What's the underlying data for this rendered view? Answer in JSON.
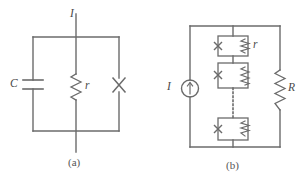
{
  "figure": {
    "caption_a": "(a)",
    "caption_b": "(b)",
    "stroke_color": "#6b6b6b",
    "text_color": "#4a4a4a",
    "background": "#ffffff",
    "width": 304,
    "height": 187
  },
  "panel_a": {
    "name": "RCSJ parallel circuit",
    "current_label": "I",
    "capacitor_label": "C",
    "resistor_label": "r",
    "junction_symbol": "X",
    "branches": [
      {
        "id": "capacitor-branch",
        "component": "capacitor",
        "label": "C"
      },
      {
        "id": "resistor-branch",
        "component": "resistor",
        "label": "r"
      },
      {
        "id": "junction-branch",
        "component": "josephson-junction",
        "label": "X"
      }
    ]
  },
  "panel_b": {
    "name": "Array of junctions with shunt resistor",
    "source_label": "I",
    "source_type": "current-source",
    "cell_label": "r",
    "shunt_label": "R",
    "cells": [
      {
        "id": "cell-1",
        "junction": "X",
        "resistor": "r"
      },
      {
        "id": "cell-2",
        "junction": "X",
        "resistor": "r"
      },
      {
        "id": "cell-n",
        "junction": "X",
        "resistor": "r"
      }
    ],
    "ellipsis": "dotted-connection"
  }
}
